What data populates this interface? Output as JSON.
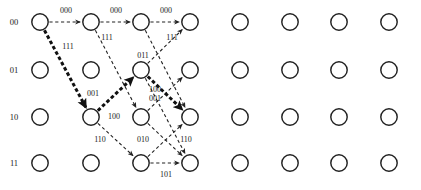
{
  "figure": {
    "type": "trellis-diagram",
    "title": "",
    "width": 421,
    "height": 190,
    "background": "#ffffff",
    "ink_color": "#222222",
    "highlight_color": "#111111"
  },
  "axis": {
    "row_labels": [
      "00",
      "01",
      "10",
      "11"
    ],
    "row_label_x": 14,
    "row_centers_y": [
      22,
      70,
      117,
      163
    ],
    "column_centers_x": [
      40,
      91,
      141,
      190,
      240,
      290,
      339,
      389
    ],
    "node_radius": 8.2
  },
  "nodes": [
    {
      "id": "n00c0",
      "row": 0,
      "col": 0
    },
    {
      "id": "n00c1",
      "row": 0,
      "col": 1
    },
    {
      "id": "n00c2",
      "row": 0,
      "col": 2
    },
    {
      "id": "n00c3",
      "row": 0,
      "col": 3
    },
    {
      "id": "n00c4",
      "row": 0,
      "col": 4
    },
    {
      "id": "n00c5",
      "row": 0,
      "col": 5
    },
    {
      "id": "n00c6",
      "row": 0,
      "col": 6
    },
    {
      "id": "n00c7",
      "row": 0,
      "col": 7
    },
    {
      "id": "n01c0",
      "row": 1,
      "col": 0
    },
    {
      "id": "n01c1",
      "row": 1,
      "col": 1
    },
    {
      "id": "n01c2",
      "row": 1,
      "col": 2
    },
    {
      "id": "n01c3",
      "row": 1,
      "col": 3
    },
    {
      "id": "n01c4",
      "row": 1,
      "col": 4
    },
    {
      "id": "n01c5",
      "row": 1,
      "col": 5
    },
    {
      "id": "n01c6",
      "row": 1,
      "col": 6
    },
    {
      "id": "n01c7",
      "row": 1,
      "col": 7
    },
    {
      "id": "n10c0",
      "row": 2,
      "col": 0
    },
    {
      "id": "n10c1",
      "row": 2,
      "col": 1
    },
    {
      "id": "n10c2",
      "row": 2,
      "col": 2
    },
    {
      "id": "n10c3",
      "row": 2,
      "col": 3
    },
    {
      "id": "n10c4",
      "row": 2,
      "col": 4
    },
    {
      "id": "n10c5",
      "row": 2,
      "col": 5
    },
    {
      "id": "n10c6",
      "row": 2,
      "col": 6
    },
    {
      "id": "n10c7",
      "row": 2,
      "col": 7
    },
    {
      "id": "n11c0",
      "row": 3,
      "col": 0
    },
    {
      "id": "n11c1",
      "row": 3,
      "col": 1
    },
    {
      "id": "n11c2",
      "row": 3,
      "col": 2
    },
    {
      "id": "n11c3",
      "row": 3,
      "col": 3
    },
    {
      "id": "n11c4",
      "row": 3,
      "col": 4
    },
    {
      "id": "n11c5",
      "row": 3,
      "col": 5
    },
    {
      "id": "n11c6",
      "row": 3,
      "col": 6
    },
    {
      "id": "n11c7",
      "row": 3,
      "col": 7
    }
  ],
  "edges": [
    {
      "from_row": 0,
      "from_col": 0,
      "to_row": 0,
      "to_col": 1,
      "style": "thin",
      "label": "000"
    },
    {
      "from_row": 0,
      "from_col": 1,
      "to_row": 0,
      "to_col": 2,
      "style": "thin",
      "label": "000"
    },
    {
      "from_row": 0,
      "from_col": 2,
      "to_row": 0,
      "to_col": 3,
      "style": "thin",
      "label": "000"
    },
    {
      "from_row": 0,
      "from_col": 0,
      "to_row": 2,
      "to_col": 1,
      "style": "thick",
      "label": "111"
    },
    {
      "from_row": 0,
      "from_col": 1,
      "to_row": 2,
      "to_col": 2,
      "style": "thin",
      "label": "111"
    },
    {
      "from_row": 0,
      "from_col": 2,
      "to_row": 2,
      "to_col": 3,
      "style": "thin",
      "label": "111"
    },
    {
      "from_row": 2,
      "from_col": 1,
      "to_row": 1,
      "to_col": 2,
      "style": "thick",
      "label": "001"
    },
    {
      "from_row": 2,
      "from_col": 2,
      "to_row": 1,
      "to_col": 3,
      "style": "thin",
      "label": "001"
    },
    {
      "from_row": 1,
      "from_col": 2,
      "to_row": 2,
      "to_col": 3,
      "style": "thick",
      "label": "100"
    },
    {
      "from_row": 2,
      "from_col": 1,
      "to_row": 3,
      "to_col": 2,
      "style": "thin",
      "label": "110"
    },
    {
      "from_row": 2,
      "from_col": 2,
      "to_row": 3,
      "to_col": 3,
      "style": "thin",
      "label": "110"
    },
    {
      "from_row": 1,
      "from_col": 2,
      "to_row": 3,
      "to_col": 3,
      "style": "thin",
      "label": "010"
    },
    {
      "from_row": 3,
      "from_col": 2,
      "to_row": 2,
      "to_col": 3,
      "style": "thin",
      "label": "100"
    },
    {
      "from_row": 3,
      "from_col": 2,
      "to_row": 3,
      "to_col": 3,
      "style": "thin",
      "label": "101"
    },
    {
      "from_row": 1,
      "from_col": 2,
      "to_row": 0,
      "to_col": 3,
      "style": "thin",
      "label": "011"
    }
  ],
  "edge_labels": [
    {
      "text": "000",
      "x": 66,
      "y": 13
    },
    {
      "text": "000",
      "x": 116,
      "y": 13
    },
    {
      "text": "000",
      "x": 166,
      "y": 13
    },
    {
      "text": "111",
      "x": 68,
      "y": 49
    },
    {
      "text": "111",
      "x": 107,
      "y": 40
    },
    {
      "text": "111",
      "x": 172,
      "y": 40
    },
    {
      "text": "011",
      "x": 143,
      "y": 58
    },
    {
      "text": "001",
      "x": 93,
      "y": 96
    },
    {
      "text": "100",
      "x": 155,
      "y": 92
    },
    {
      "text": "001",
      "x": 155,
      "y": 101
    },
    {
      "text": "100",
      "x": 114,
      "y": 119
    },
    {
      "text": "110",
      "x": 100,
      "y": 142
    },
    {
      "text": "010",
      "x": 143,
      "y": 142
    },
    {
      "text": "110",
      "x": 186,
      "y": 142
    },
    {
      "text": "101",
      "x": 166,
      "y": 177
    }
  ]
}
